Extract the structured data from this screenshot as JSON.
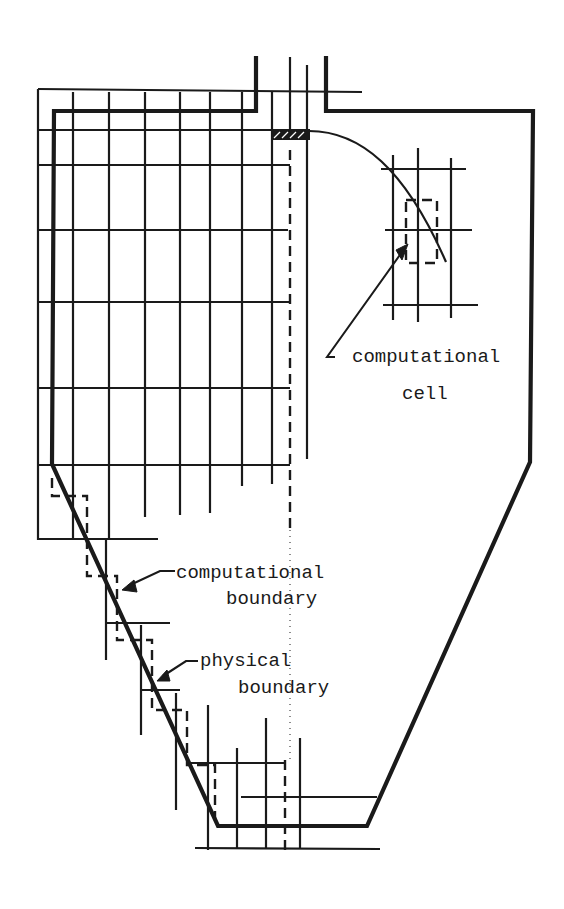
{
  "figure": {
    "type": "schematic"
  },
  "labels": {
    "computational_cell": {
      "line1": "computational",
      "line2": "cell"
    },
    "computational_boundary": {
      "line1": "computational",
      "line2": "boundary"
    },
    "physical_boundary": {
      "line1": "physical",
      "line2": "boundary"
    }
  },
  "colors": {
    "ink": "#1a1a1a",
    "background": "#ffffff"
  }
}
